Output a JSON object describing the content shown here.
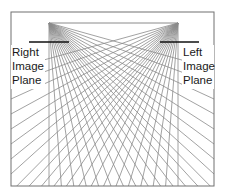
{
  "diagram": {
    "colors": {
      "rays": "#8a8a8a",
      "frame": "#707070",
      "plane": "#111111",
      "text": "#1a1a1a"
    },
    "frame": {
      "left": 11,
      "top": 12,
      "right": 214,
      "bottom": 186
    },
    "right_camera": {
      "focal_point": [
        49,
        23
      ],
      "image_plane": {
        "x1": 29,
        "x2": 69,
        "y": 42
      },
      "label_lines": [
        "Right",
        "Image",
        "Plane"
      ]
    },
    "left_camera": {
      "focal_point": [
        178,
        23
      ],
      "image_plane": {
        "x1": 160,
        "x2": 199,
        "y": 42
      },
      "label_lines": [
        "Left",
        "Image",
        "Plane"
      ]
    },
    "rays_per_camera": 22
  }
}
